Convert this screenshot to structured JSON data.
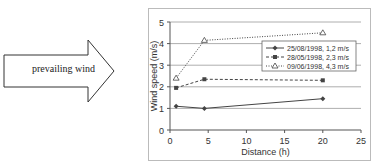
{
  "arrow": {
    "label": "prevailing wind"
  },
  "chart_data": {
    "type": "line",
    "title": "",
    "xlabel": "Distance (h)",
    "ylabel": "Wind speed  (m/s)",
    "xlim": [
      0,
      25
    ],
    "ylim": [
      0,
      5
    ],
    "xticks": [
      0,
      5,
      10,
      15,
      20,
      25
    ],
    "yticks": [
      0,
      1,
      2,
      3,
      4,
      5
    ],
    "grid": "horizontal",
    "legend_position": "upper right inside",
    "series": [
      {
        "name": "25/08/1998, 1,2 m/s",
        "marker": "diamond",
        "style": "solid",
        "x": [
          0.8,
          4.5,
          20
        ],
        "values": [
          1.1,
          1.0,
          1.45
        ]
      },
      {
        "name": "28/05/1998, 2,3 m/s",
        "marker": "square",
        "style": "dashed",
        "x": [
          0.8,
          4.5,
          20
        ],
        "values": [
          1.95,
          2.35,
          2.3
        ]
      },
      {
        "name": "09/06/1998, 4,3 m/s",
        "marker": "triangle",
        "style": "dotted",
        "x": [
          0.8,
          4.5,
          20
        ],
        "values": [
          2.4,
          4.15,
          4.5
        ]
      }
    ]
  }
}
